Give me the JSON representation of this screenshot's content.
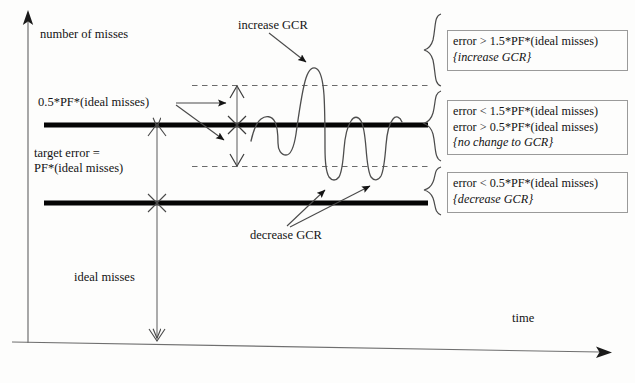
{
  "figure": {
    "type": "diagram",
    "axes": {
      "y_label": "number of misses",
      "x_label": "time"
    },
    "labels": {
      "half_pf": "0.5*PF*(ideal misses)",
      "target_error_line1": "target error =",
      "target_error_line2": "PF*(ideal misses)",
      "ideal_misses": "ideal misses",
      "increase_gcr": "increase GCR",
      "decrease_gcr": "decrease GCR"
    },
    "rule_boxes": [
      {
        "id": "increase",
        "lines": [
          "error > 1.5*PF*(ideal misses)"
        ],
        "action": "{increase GCR}"
      },
      {
        "id": "no-change",
        "lines": [
          "error < 1.5*PF*(ideal misses)",
          "error > 0.5*PF*(ideal misses)"
        ],
        "action": "{no change to GCR}"
      },
      {
        "id": "decrease",
        "lines": [
          "error < 0.5*PF*(ideal misses)"
        ],
        "action": "{decrease GCR}"
      }
    ],
    "colors": {
      "ink": "#141414",
      "thick_line": "#050505",
      "thin_line": "#5a5a5a",
      "dashed_line": "#6b6b6b",
      "box_border": "#9a9a9a"
    },
    "reference_levels": {
      "upper_dashed": "1.5*PF*(ideal misses)",
      "upper_thick": "PF*(ideal misses) target error",
      "lower_dashed": "0.5*PF*(ideal misses)",
      "lower_thick": "ideal misses"
    }
  }
}
